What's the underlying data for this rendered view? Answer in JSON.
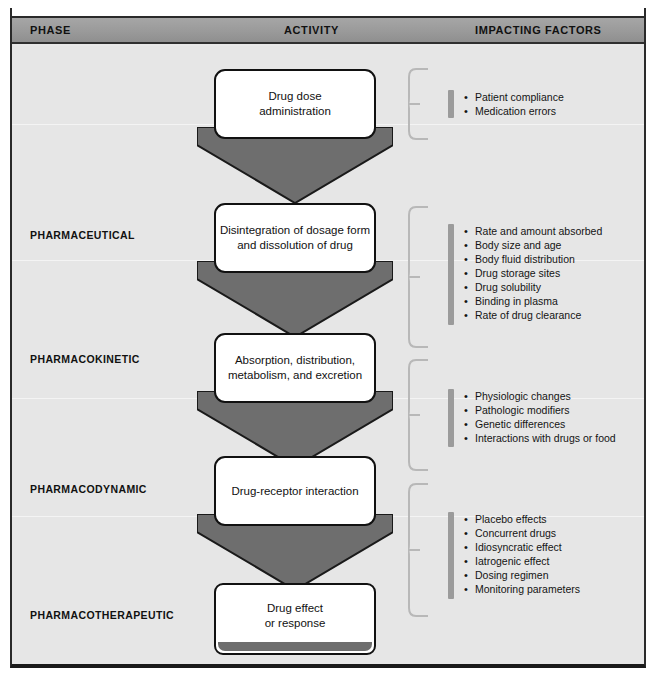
{
  "header": {
    "columns": [
      {
        "key": "phase",
        "label": "PHASE"
      },
      {
        "key": "activity",
        "label": "ACTIVITY"
      },
      {
        "key": "factors",
        "label": "IMPACTING FACTORS"
      }
    ]
  },
  "phases": [
    {
      "label": "PHARMACEUTICAL"
    },
    {
      "label": "PHARMACOKINETIC"
    },
    {
      "label": "PHARMACODYNAMIC"
    },
    {
      "label": "PHARMACOTHERAPEUTIC"
    }
  ],
  "activities": [
    {
      "text": "Drug dose\nadministration"
    },
    {
      "text": "Disintegration of dosage form\nand dissolution of drug"
    },
    {
      "text": "Absorption, distribution,\nmetabolism, and excretion"
    },
    {
      "text": "Drug-receptor interaction"
    },
    {
      "text": "Drug effect\nor response"
    }
  ],
  "factor_groups": [
    {
      "items": [
        "Patient compliance",
        "Medication errors"
      ]
    },
    {
      "items": [
        "Rate and amount absorbed",
        "Body size and age",
        "Body fluid distribution",
        "Drug storage sites",
        "Drug solubility",
        "Binding in plasma",
        "Rate of drug clearance"
      ]
    },
    {
      "items": [
        "Physiologic changes",
        "Pathologic modifiers",
        "Genetic differences",
        "Interactions with drugs or food"
      ]
    },
    {
      "items": [
        "Placebo effects",
        "Concurrent drugs",
        "Idiosyncratic effect",
        "Iatrogenic effect",
        "Dosing regimen",
        "Monitoring parameters"
      ]
    }
  ],
  "colors": {
    "arrow_fill": "#6e6e6e",
    "arrow_stroke": "#1a1a1a",
    "header_band": "#9a9a9a",
    "canvas": "#e6e6e6",
    "box_fill": "#ffffff",
    "box_stroke": "#111111",
    "brace": "#b8b8b8",
    "accent_bar": "#9b9b9b"
  }
}
